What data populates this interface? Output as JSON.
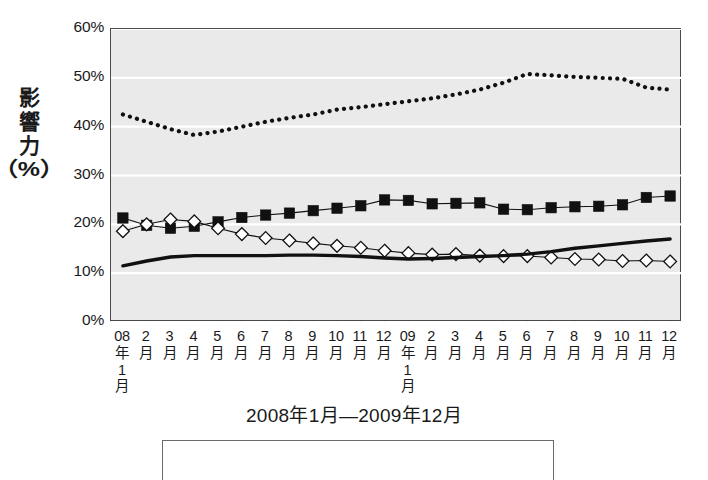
{
  "chart_data": {
    "type": "line",
    "title": "",
    "xlabel": "2008年1月—2009年12月",
    "ylabel": "影響力（%）",
    "ylabel_chars": [
      "影",
      "響",
      "力",
      "（%）"
    ],
    "ylim": [
      0,
      60
    ],
    "ytick_labels": [
      "60%",
      "50%",
      "40%",
      "30%",
      "20%",
      "10%",
      "0%"
    ],
    "ytick_values": [
      60,
      50,
      40,
      30,
      20,
      10,
      0
    ],
    "grid": true,
    "grid_color": "#ffffff",
    "plot_background": "#eaeaea",
    "legend_position": "bottom",
    "categories": [
      "08年1月",
      "2月",
      "3月",
      "4月",
      "5月",
      "6月",
      "7月",
      "8月",
      "9月",
      "10月",
      "11月",
      "12月",
      "09年1月",
      "2月",
      "3月",
      "4月",
      "5月",
      "6月",
      "7月",
      "8月",
      "9月",
      "10月",
      "11月",
      "12月"
    ],
    "xtick_labels": [
      {
        "top": "08",
        "mid": "年",
        "low1": "1",
        "low2": "月"
      },
      {
        "top": "2",
        "mid": "月"
      },
      {
        "top": "3",
        "mid": "月"
      },
      {
        "top": "4",
        "mid": "月"
      },
      {
        "top": "5",
        "mid": "月"
      },
      {
        "top": "6",
        "mid": "月"
      },
      {
        "top": "7",
        "mid": "月"
      },
      {
        "top": "8",
        "mid": "月"
      },
      {
        "top": "9",
        "mid": "月"
      },
      {
        "top": "10",
        "mid": "月"
      },
      {
        "top": "11",
        "mid": "月"
      },
      {
        "top": "12",
        "mid": "月"
      },
      {
        "top": "09",
        "mid": "年",
        "low1": "1",
        "low2": "月"
      },
      {
        "top": "2",
        "mid": "月"
      },
      {
        "top": "3",
        "mid": "月"
      },
      {
        "top": "4",
        "mid": "月"
      },
      {
        "top": "5",
        "mid": "月"
      },
      {
        "top": "6",
        "mid": "月"
      },
      {
        "top": "7",
        "mid": "月"
      },
      {
        "top": "8",
        "mid": "月"
      },
      {
        "top": "9",
        "mid": "月"
      },
      {
        "top": "10",
        "mid": "月"
      },
      {
        "top": "11",
        "mid": "月"
      },
      {
        "top": "12",
        "mid": "月"
      }
    ],
    "series": [
      {
        "name": "dotted-series",
        "style": "dotted",
        "marker": "none",
        "color": "#111111",
        "values": [
          42.5,
          41.0,
          39.5,
          38.3,
          39.0,
          40.0,
          41.0,
          41.8,
          42.5,
          43.5,
          44.0,
          44.6,
          45.2,
          45.8,
          46.6,
          47.6,
          49.0,
          50.8,
          50.5,
          50.2,
          50.0,
          49.8,
          48.0,
          47.6
        ]
      },
      {
        "name": "filled-square-series",
        "style": "solid-thin",
        "marker": "square-filled",
        "color": "#111111",
        "values": [
          21.3,
          19.8,
          19.2,
          19.6,
          20.5,
          21.4,
          21.9,
          22.3,
          22.8,
          23.3,
          23.8,
          25.0,
          24.9,
          24.2,
          24.3,
          24.4,
          23.1,
          23.0,
          23.4,
          23.6,
          23.7,
          24.0,
          25.5,
          25.8
        ]
      },
      {
        "name": "open-diamond-series",
        "style": "solid-thin",
        "marker": "diamond-open",
        "color": "#111111",
        "values": [
          18.6,
          20.0,
          21.0,
          20.6,
          19.2,
          18.0,
          17.2,
          16.7,
          16.1,
          15.6,
          15.2,
          14.6,
          14.1,
          13.8,
          13.9,
          13.6,
          13.5,
          13.5,
          13.2,
          12.9,
          12.8,
          12.5,
          12.6,
          12.4
        ]
      },
      {
        "name": "thick-solid-series",
        "style": "solid-thick",
        "marker": "none",
        "color": "#111111",
        "values": [
          11.5,
          12.5,
          13.3,
          13.6,
          13.6,
          13.6,
          13.6,
          13.7,
          13.7,
          13.6,
          13.4,
          13.1,
          12.9,
          13.0,
          13.2,
          13.4,
          13.6,
          13.9,
          14.4,
          15.1,
          15.6,
          16.1,
          16.6,
          17.0
        ]
      }
    ]
  }
}
